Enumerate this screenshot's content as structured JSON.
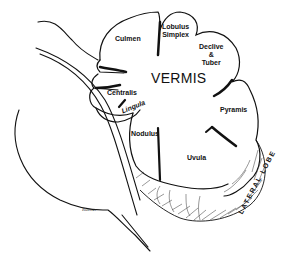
{
  "diagram": {
    "title": "VERMIS",
    "lobules": [
      {
        "id": "culmen",
        "label": "Culmen"
      },
      {
        "id": "lobulus-simplex",
        "label_line1": "Lobulus",
        "label_line2": "Simplex"
      },
      {
        "id": "declive-tuber",
        "label_line1": "Declive",
        "label_line2": "&",
        "label_line3": "Tuber"
      },
      {
        "id": "centralis",
        "label": "Centralis"
      },
      {
        "id": "lingula",
        "label": "Lingula"
      },
      {
        "id": "pyramis",
        "label": "Pyramis"
      },
      {
        "id": "nodulus",
        "label": "Nodulus"
      },
      {
        "id": "uvula",
        "label": "Uvula"
      }
    ],
    "lateral_lobe": "LATERAL LOBE",
    "signature": "Rubner"
  },
  "colors": {
    "ink": "#111111",
    "background": "#ffffff"
  }
}
